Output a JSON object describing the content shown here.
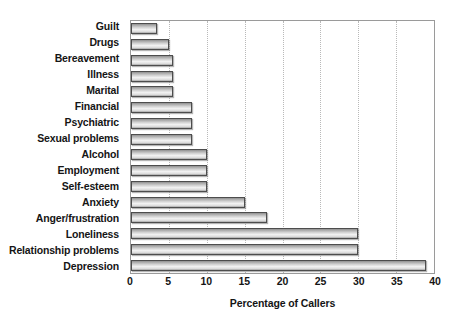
{
  "chart_data": {
    "type": "bar",
    "orientation": "horizontal",
    "title": "",
    "xlabel": "Percentage of Callers",
    "ylabel": "",
    "xlim": [
      0,
      40
    ],
    "xticks": [
      0,
      5,
      10,
      15,
      20,
      25,
      30,
      35,
      40
    ],
    "grid": "vertical-dotted",
    "legend": "none",
    "categories": [
      "Guilt",
      "Drugs",
      "Bereavement",
      "Illness",
      "Marital",
      "Financial",
      "Psychiatric",
      "Sexual problems",
      "Alcohol",
      "Employment",
      "Self-esteem",
      "Anxiety",
      "Anger/frustration",
      "Loneliness",
      "Relationship problems",
      "Depression"
    ],
    "values": [
      3.4,
      5.0,
      5.6,
      5.6,
      5.6,
      8.0,
      8.0,
      8.0,
      10.0,
      10.0,
      10.0,
      15.0,
      18.0,
      30.0,
      30.0,
      39.0
    ]
  },
  "colors": {
    "bar_border": "#4d4d4d",
    "bar_fill_light": "#f2f2f2",
    "bar_fill_dark": "#8f8f8f",
    "gridline": "#b9b9b9",
    "frame": "#9a9a9a",
    "text": "#151515",
    "background": "#ffffff"
  }
}
